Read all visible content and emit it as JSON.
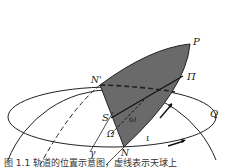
{
  "diagram": {
    "labels": {
      "P": "P",
      "Pi": "Π",
      "N_prime": "N'",
      "Q": "Q",
      "S": "S",
      "omega": "ω",
      "Omega": "Ω",
      "i": "ι",
      "gamma": "γ",
      "N": "N"
    },
    "caption": "图 1.1  轨道的位置示意图，虚线表示天球上"
  }
}
